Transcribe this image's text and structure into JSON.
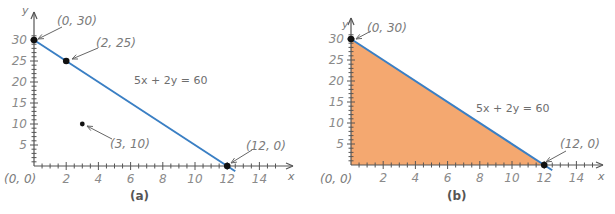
{
  "chart_data": [
    {
      "type": "line",
      "caption": "(a)",
      "title": "",
      "xlabel": "x",
      "ylabel": "y",
      "xlim": [
        0,
        15
      ],
      "ylim": [
        0,
        32
      ],
      "x_ticks": [
        2,
        4,
        6,
        8,
        10,
        12,
        14
      ],
      "y_ticks": [
        5,
        10,
        15,
        20,
        25,
        30
      ],
      "origin_label": "(0, 0)",
      "grid": false,
      "line": {
        "equation": "5x + 2y = 60",
        "from": [
          0,
          30
        ],
        "to": [
          12.5,
          -1.25
        ],
        "color": "#3A7FC4"
      },
      "points": [
        {
          "x": 0,
          "y": 30,
          "label": "(0, 30)",
          "on_line": true
        },
        {
          "x": 2,
          "y": 25,
          "label": "(2, 25)",
          "on_line": true
        },
        {
          "x": 3,
          "y": 10,
          "label": "(3, 10)",
          "on_line": false
        },
        {
          "x": 12,
          "y": 0,
          "label": "(12, 0)",
          "on_line": true
        }
      ],
      "shaded_region": null
    },
    {
      "type": "area",
      "caption": "(b)",
      "title": "",
      "xlabel": "x",
      "ylabel": "y",
      "xlim": [
        0,
        15
      ],
      "ylim": [
        0,
        32
      ],
      "x_ticks": [
        2,
        4,
        6,
        8,
        10,
        12,
        14
      ],
      "y_ticks": [
        5,
        10,
        15,
        20,
        25,
        30
      ],
      "origin_label": "(0, 0)",
      "grid": false,
      "line": {
        "equation": "5x + 2y = 60",
        "from": [
          0,
          30
        ],
        "to": [
          12.5,
          -1.25
        ],
        "color": "#3A7FC4"
      },
      "points": [
        {
          "x": 0,
          "y": 30,
          "label": "(0, 30)",
          "on_line": true
        },
        {
          "x": 12,
          "y": 0,
          "label": "(12, 0)",
          "on_line": true
        }
      ],
      "shaded_region": {
        "description": "5x + 2y <= 60, x >= 0, y >= 0",
        "vertices": [
          [
            0,
            0
          ],
          [
            0,
            30
          ],
          [
            12,
            0
          ]
        ],
        "color": "#F4A870"
      }
    }
  ],
  "panels": {
    "a": {
      "caption": "(a)",
      "equation": "5x + 2y = 60",
      "origin": "(0, 0)",
      "x_axis_name": "x",
      "y_axis_name": "y",
      "labels": {
        "p0_30": "(0, 30)",
        "p2_25": "(2, 25)",
        "p3_10": "(3, 10)",
        "p12_0": "(12, 0)"
      }
    },
    "b": {
      "caption": "(b)",
      "equation": "5x + 2y = 60",
      "origin": "(0, 0)",
      "x_axis_name": "x",
      "y_axis_name": "y",
      "labels": {
        "p0_30": "(0, 30)",
        "p12_0": "(12, 0)"
      }
    },
    "x_tick_labels": [
      "2",
      "4",
      "6",
      "8",
      "10",
      "12",
      "14"
    ],
    "y_tick_labels": [
      "5",
      "10",
      "15",
      "20",
      "25",
      "30"
    ]
  },
  "colors": {
    "line": "#3A7FC4",
    "fill": "#F4A870",
    "axis": "#555555",
    "point": "#111111"
  }
}
